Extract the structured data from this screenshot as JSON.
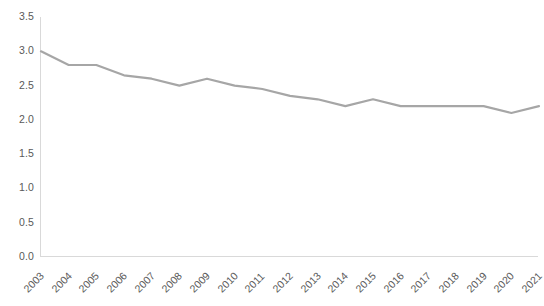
{
  "chart_data": {
    "type": "line",
    "title": "",
    "subtitle": "",
    "xlabel": "",
    "ylabel": "",
    "categories": [
      "2003",
      "2004",
      "2005",
      "2006",
      "2007",
      "2008",
      "2009",
      "2010",
      "2011",
      "2012",
      "2013",
      "2014",
      "2015",
      "2016",
      "2017",
      "2018",
      "2019",
      "2020",
      "2021"
    ],
    "values": [
      3.0,
      2.8,
      2.8,
      2.65,
      2.6,
      2.5,
      2.6,
      2.5,
      2.45,
      2.35,
      2.3,
      2.2,
      2.3,
      2.2,
      2.2,
      2.2,
      2.2,
      2.1,
      2.2
    ],
    "series": [
      {
        "name": "",
        "values": [
          3.0,
          2.8,
          2.8,
          2.65,
          2.6,
          2.5,
          2.6,
          2.5,
          2.45,
          2.35,
          2.3,
          2.2,
          2.3,
          2.2,
          2.2,
          2.2,
          2.2,
          2.1,
          2.2
        ],
        "color": "#a6a6a6"
      }
    ],
    "ylim": [
      0.0,
      3.5
    ],
    "y_ticks": [
      "0.0",
      "0.5",
      "1.0",
      "1.5",
      "2.0",
      "2.5",
      "3.0",
      "3.5"
    ],
    "y_tick_values": [
      0.0,
      0.5,
      1.0,
      1.5,
      2.0,
      2.5,
      3.0,
      3.5
    ],
    "grid": false,
    "legend": false,
    "legend_position": "none",
    "markers": false,
    "line_color": "#a6a6a6",
    "axis_color": "#d9d9d9",
    "tick_label_color": "#595959",
    "background": "#ffffff"
  },
  "caption": {
    "text": ""
  }
}
